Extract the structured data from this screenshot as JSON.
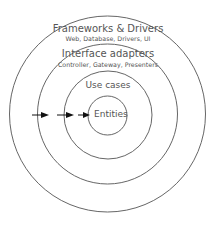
{
  "diagram": {
    "type": "concentric-circles",
    "colors": {
      "stroke": "#555555",
      "text": "#555555",
      "arrow": "#111111",
      "background": "#ffffff"
    },
    "layers": [
      {
        "title": "Frameworks & Drivers",
        "subtitle": "Web, Database, Drivers, UI"
      },
      {
        "title": "Interface adapters",
        "subtitle": "Controller, Gateway, Presenters"
      },
      {
        "title": "Use cases"
      },
      {
        "title": "Entities"
      }
    ],
    "arrows": {
      "count": 3,
      "direction": "inward"
    }
  }
}
